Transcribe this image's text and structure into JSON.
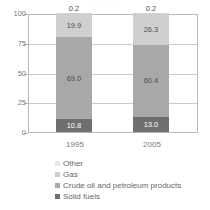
{
  "title_remnant": "· ·  · · ·   · ·  · ·",
  "legend": {
    "items": [
      {
        "label": "Other",
        "color": "#e8e8e8"
      },
      {
        "label": "Gas",
        "color": "#cfcfcf"
      },
      {
        "label": "Crude oil and petroleum products",
        "color": "#a8a8a8"
      },
      {
        "label": "Solid fuels",
        "color": "#6f6f6f"
      }
    ]
  },
  "chart_data": {
    "type": "bar",
    "stacked": true,
    "title": "",
    "xlabel": "",
    "ylabel": "",
    "categories": [
      "1995",
      "2005"
    ],
    "ylim": [
      0,
      100
    ],
    "yticks": [
      0,
      25,
      50,
      75,
      100
    ],
    "ytick_labels": [
      "0",
      "25",
      "50",
      "75",
      "100"
    ],
    "grid": true,
    "legend_position": "bottom",
    "stack_order_bottom_to_top": [
      "Solid fuels",
      "Crude oil and petroleum products",
      "Gas",
      "Other"
    ],
    "series": [
      {
        "name": "Solid fuels",
        "color": "#6f6f6f",
        "label_color": "#ffffff",
        "values": [
          10.8,
          13.0
        ],
        "labels": [
          "10.8",
          "13.0"
        ]
      },
      {
        "name": "Crude oil and petroleum products",
        "color": "#a8a8a8",
        "label_color": "#4d4d4d",
        "values": [
          69.0,
          60.4
        ],
        "labels": [
          "69.0",
          "60.4"
        ]
      },
      {
        "name": "Gas",
        "color": "#cfcfcf",
        "label_color": "#4d4d4d",
        "values": [
          19.9,
          26.3
        ],
        "labels": [
          "19.9",
          "26.3"
        ]
      },
      {
        "name": "Other",
        "color": "#e8e8e8",
        "label_color": "#4d4d4d",
        "values": [
          0.2,
          0.2
        ],
        "labels": [
          "0.2",
          "0.2"
        ]
      }
    ]
  }
}
